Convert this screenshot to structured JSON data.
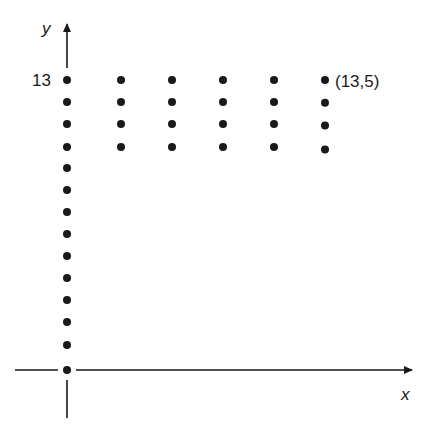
{
  "diagram": {
    "title": "",
    "axes": {
      "x_label": "x",
      "y_label": "y"
    },
    "labels": {
      "y_tick": "13",
      "point_annotation": "(13,5)"
    },
    "colors": {
      "ink": "#1a1a1a",
      "background": "#ffffff"
    },
    "layout": {
      "origin": [
        67,
        370
      ],
      "axis_column_dots_y": [
        80,
        102,
        124,
        147,
        168,
        190,
        212,
        234,
        256,
        278,
        300,
        322,
        345,
        370
      ],
      "grid_columns_x": [
        121,
        172,
        223,
        274,
        325
      ],
      "grid_rows_y": [
        80,
        102,
        124,
        147
      ]
    }
  },
  "chart_data": {
    "type": "scatter",
    "title": "",
    "xlabel": "x",
    "ylabel": "y",
    "tick_labels": {
      "y": [
        "13"
      ]
    },
    "annotations": [
      {
        "text": "(13,5)",
        "at": "top-right dot"
      }
    ],
    "series": [
      {
        "name": "y-axis points",
        "points": "14 dots along the y-axis from the origin up to y = 13"
      },
      {
        "name": "grid block",
        "points": "5 columns × 4 rows of dots to the right of the y-axis, top row aligned with y = 13; top-right dot labeled (13,5)"
      }
    ],
    "grid": false,
    "legend": null
  }
}
